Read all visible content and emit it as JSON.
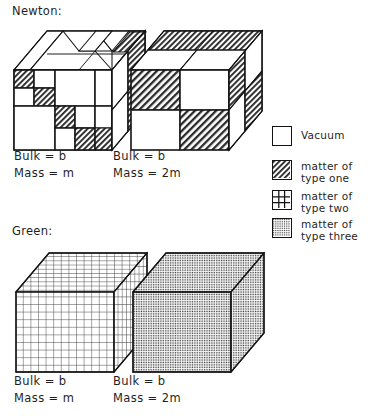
{
  "figure": {
    "sections": [
      {
        "id": "newton",
        "label": "Newton:"
      },
      {
        "id": "green",
        "label": "Green:"
      }
    ],
    "captions": [
      {
        "id": "newton-left",
        "bulk": "Bulk = b",
        "mass": "Mass = m"
      },
      {
        "id": "newton-right",
        "bulk": "Bulk = b",
        "mass": "Mass = 2m"
      },
      {
        "id": "green-left",
        "bulk": "Bulk = b",
        "mass": "Mass = m"
      },
      {
        "id": "green-right",
        "bulk": "Bulk = b",
        "mass": "Mass = 2m"
      }
    ],
    "legend": {
      "items": [
        {
          "swatch": "empty-swatch",
          "fill": "vacuum",
          "line1": "Vacuum",
          "line2": ""
        },
        {
          "swatch": "diagonal-hatch-swatch",
          "fill": "type-one",
          "line1": "matter of",
          "line2": "type one"
        },
        {
          "swatch": "cross-grid-swatch",
          "fill": "type-two",
          "line1": "matter of",
          "line2": "type two"
        },
        {
          "swatch": "stipple-swatch",
          "fill": "type-three",
          "line1": "matter of",
          "line2": "type three"
        }
      ]
    },
    "colors": {
      "ink": "#141414",
      "paper": "#ffffff",
      "hatch": "#2a2a2a",
      "stipple": "#3a3a3a"
    }
  }
}
